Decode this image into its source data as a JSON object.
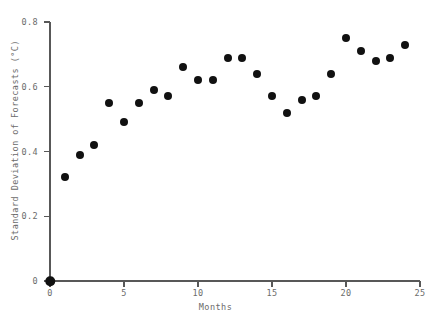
{
  "chart_data": {
    "type": "scatter",
    "title": "",
    "xlabel": "Months",
    "ylabel": "Standard Deviation of Forecasts (°C)",
    "xlim": [
      0,
      25
    ],
    "ylim": [
      0,
      0.8
    ],
    "grid": false,
    "legend": null,
    "marker": {
      "shape": "circle",
      "color": "#111111",
      "size_px": 8
    },
    "x_ticks": [
      {
        "value": 0,
        "label": "0"
      },
      {
        "value": 5,
        "label": "5"
      },
      {
        "value": 10,
        "label": "10"
      },
      {
        "value": 15,
        "label": "15"
      },
      {
        "value": 20,
        "label": "20"
      },
      {
        "value": 25,
        "label": "25"
      }
    ],
    "y_ticks": [
      {
        "value": 0,
        "label": "0"
      },
      {
        "value": 0.2,
        "label": "0.2"
      },
      {
        "value": 0.4,
        "label": "0.4"
      },
      {
        "value": 0.6,
        "label": "0.6"
      },
      {
        "value": 0.8,
        "label": "0.8"
      }
    ],
    "x": [
      0,
      1,
      2,
      3,
      4,
      5,
      6,
      7,
      8,
      9,
      10,
      11,
      12,
      13,
      14,
      15,
      16,
      17,
      18,
      19,
      20,
      21,
      22,
      23,
      24
    ],
    "values": [
      0.0,
      0.32,
      0.39,
      0.42,
      0.55,
      0.49,
      0.55,
      0.59,
      0.57,
      0.66,
      0.62,
      0.62,
      0.69,
      0.69,
      0.64,
      0.57,
      0.52,
      0.56,
      0.57,
      0.64,
      0.75,
      0.71,
      0.68,
      0.69,
      0.73
    ],
    "points": [
      {
        "month": 0,
        "sd": 0.0
      },
      {
        "month": 1,
        "sd": 0.32
      },
      {
        "month": 2,
        "sd": 0.39
      },
      {
        "month": 3,
        "sd": 0.42
      },
      {
        "month": 4,
        "sd": 0.55
      },
      {
        "month": 5,
        "sd": 0.49
      },
      {
        "month": 6,
        "sd": 0.55
      },
      {
        "month": 7,
        "sd": 0.59
      },
      {
        "month": 8,
        "sd": 0.57
      },
      {
        "month": 9,
        "sd": 0.66
      },
      {
        "month": 10,
        "sd": 0.62
      },
      {
        "month": 11,
        "sd": 0.62
      },
      {
        "month": 12,
        "sd": 0.69
      },
      {
        "month": 13,
        "sd": 0.69
      },
      {
        "month": 14,
        "sd": 0.64
      },
      {
        "month": 15,
        "sd": 0.57
      },
      {
        "month": 16,
        "sd": 0.52
      },
      {
        "month": 17,
        "sd": 0.56
      },
      {
        "month": 18,
        "sd": 0.57
      },
      {
        "month": 19,
        "sd": 0.64
      },
      {
        "month": 20,
        "sd": 0.75
      },
      {
        "month": 21,
        "sd": 0.71
      },
      {
        "month": 22,
        "sd": 0.68
      },
      {
        "month": 23,
        "sd": 0.69
      },
      {
        "month": 24,
        "sd": 0.73
      }
    ]
  },
  "colors": {
    "marker": "#111111",
    "axis": "#585858",
    "text": "#6b6b6b",
    "background": "#ffffff"
  }
}
